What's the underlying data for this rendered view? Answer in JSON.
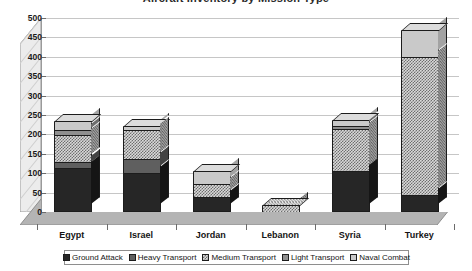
{
  "title": "Aircraft Inventory by Mission Type",
  "chart_data": {
    "type": "bar",
    "subtype": "stacked-column-3d",
    "title": "Aircraft Inventory by Mission Type",
    "xlabel": "",
    "ylabel": "",
    "ylim": [
      0,
      500
    ],
    "yticks": [
      0,
      50,
      100,
      150,
      200,
      250,
      300,
      350,
      400,
      450,
      500
    ],
    "ytick_labels": [
      "0",
      "50",
      "100",
      "150",
      "200",
      "250",
      "300",
      "350",
      "400",
      "450",
      "500"
    ],
    "grid": true,
    "legend_position": "bottom",
    "categories": [
      "Egypt",
      "Israel",
      "Jordan",
      "Lebanon",
      "Syria",
      "Turkey"
    ],
    "series": [
      {
        "name": "Ground Attack",
        "pattern": "solid-dark",
        "values": [
          113,
          100,
          38,
          0,
          105,
          45
        ]
      },
      {
        "name": "Heavy Transport",
        "pattern": "solid-gray",
        "values": [
          17,
          37,
          0,
          0,
          0,
          0
        ]
      },
      {
        "name": "Medium Transport",
        "pattern": "checker-light",
        "values": [
          68,
          75,
          33,
          18,
          110,
          355
        ]
      },
      {
        "name": "Light Transport",
        "pattern": "solid-midgray",
        "values": [
          13,
          0,
          0,
          0,
          8,
          0
        ]
      },
      {
        "name": "Naval Combat",
        "pattern": "solid-lightgray",
        "values": [
          24,
          9,
          34,
          0,
          14,
          70
        ]
      }
    ],
    "totals": [
      235,
      221,
      105,
      18,
      237,
      470
    ]
  },
  "legend": {
    "items": [
      {
        "label": "Ground Attack"
      },
      {
        "label": "Heavy Transport"
      },
      {
        "label": "Medium Transport"
      },
      {
        "label": "Light Transport"
      },
      {
        "label": "Naval Combat"
      }
    ]
  }
}
